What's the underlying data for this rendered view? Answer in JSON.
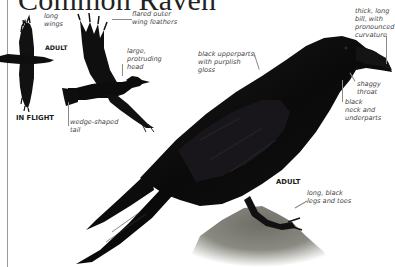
{
  "title": "Common Raven",
  "figures": {
    "flight_small": {
      "tag": "ADULT",
      "caption": "IN FLIGHT"
    },
    "perched": {
      "tag": "ADULT"
    }
  },
  "annotations": {
    "long_wings": "long\nwings",
    "flared_outer_wing_feathers": "flared outer\nwing feathers",
    "large_protruding_head": "large,\nprotruding\nhead",
    "wedge_shaped_tail": "wedge-shaped\ntail",
    "black_upperparts": "black upperparts,\nwith purplish\ngloss",
    "thick_long_bill": "thick, long\nbill, with\npronounced\ncurvature",
    "shaggy_throat": "shaggy\nthroat",
    "black_neck_underparts": "black\nneck and\nunderparts",
    "long_black_legs": "long, black\nlegs and toes"
  },
  "colors": {
    "plumage": "#0d0d0d",
    "gloss": "#2a2433",
    "rock": "#6e6e66",
    "rule": "#9a9a9a",
    "label_text": "#444444"
  }
}
